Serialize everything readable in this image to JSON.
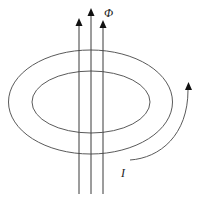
{
  "diagram": {
    "labels": {
      "flux": "Φ",
      "current": "I"
    },
    "colors": {
      "background": "#ffffff",
      "line": "#3a3a3a",
      "ring": "#5a5a5a",
      "arrowhead": "#111111"
    },
    "ring": {
      "outer": {
        "cx": 90.5,
        "cy": 102,
        "rx": 82,
        "ry": 52
      },
      "inner": {
        "cx": 91,
        "cy": 102,
        "rx": 59,
        "ry": 31
      }
    },
    "flux_lines": [
      {
        "x": 79,
        "tip_y": 19,
        "bottom_y": 194
      },
      {
        "x": 91,
        "tip_y": 9,
        "bottom_y": 194
      },
      {
        "x": 103,
        "tip_y": 21,
        "bottom_y": 194
      }
    ],
    "current_arrow": {
      "path": "M130,160 C160,158 188,135 188,90",
      "tip": [
        188,
        82
      ]
    }
  }
}
